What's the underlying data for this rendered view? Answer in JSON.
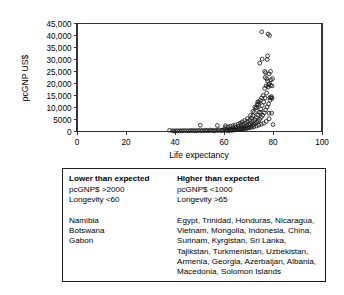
{
  "chart_data": {
    "type": "scatter",
    "title": "",
    "xlabel": "Life expectancy",
    "ylabel": "pcGNP US$",
    "xlim": [
      0,
      100
    ],
    "ylim": [
      0,
      45000
    ],
    "xticks": [
      "0",
      "20",
      "40",
      "60",
      "80",
      "100"
    ],
    "xtick_values": [
      0,
      20,
      40,
      60,
      80,
      100
    ],
    "yticks": [
      "0",
      "5000",
      "10,000",
      "15,000",
      "20,000",
      "25,000",
      "30,000",
      "35,000",
      "40,000",
      "45,000"
    ],
    "ytick_values": [
      0,
      5000,
      10000,
      15000,
      20000,
      25000,
      30000,
      35000,
      40000,
      45000
    ],
    "grid": false,
    "legend": "none",
    "marker": "open-circle",
    "points": [
      [
        37.8,
        500
      ],
      [
        39.0,
        300
      ],
      [
        39.6,
        220
      ],
      [
        40.3,
        260
      ],
      [
        41.0,
        300
      ],
      [
        41.8,
        240
      ],
      [
        42.5,
        330
      ],
      [
        43.2,
        280
      ],
      [
        44.0,
        400
      ],
      [
        44.8,
        250
      ],
      [
        45.5,
        350
      ],
      [
        46.2,
        300
      ],
      [
        46.9,
        420
      ],
      [
        47.6,
        280
      ],
      [
        48.3,
        360
      ],
      [
        49.0,
        300
      ],
      [
        49.7,
        450
      ],
      [
        50.3,
        2600
      ],
      [
        50.6,
        330
      ],
      [
        51.2,
        400
      ],
      [
        51.9,
        300
      ],
      [
        52.5,
        520
      ],
      [
        53.1,
        380
      ],
      [
        53.8,
        300
      ],
      [
        54.4,
        600
      ],
      [
        55.0,
        420
      ],
      [
        55.6,
        350
      ],
      [
        56.2,
        300
      ],
      [
        56.8,
        480
      ],
      [
        57.3,
        2500
      ],
      [
        57.5,
        420
      ],
      [
        58.1,
        700
      ],
      [
        58.7,
        380
      ],
      [
        59.2,
        500
      ],
      [
        59.8,
        450
      ],
      [
        60.3,
        900
      ],
      [
        60.6,
        2400
      ],
      [
        60.9,
        600
      ],
      [
        61.4,
        700
      ],
      [
        61.9,
        450
      ],
      [
        62.4,
        1100
      ],
      [
        62.9,
        800
      ],
      [
        63.3,
        600
      ],
      [
        63.7,
        1500
      ],
      [
        64.1,
        900
      ],
      [
        64.5,
        700
      ],
      [
        64.9,
        1900
      ],
      [
        65.2,
        1200
      ],
      [
        65.6,
        800
      ],
      [
        66.0,
        2100
      ],
      [
        66.3,
        1400
      ],
      [
        66.7,
        1000
      ],
      [
        67.0,
        2600
      ],
      [
        67.3,
        1700
      ],
      [
        67.6,
        1100
      ],
      [
        67.9,
        3100
      ],
      [
        68.2,
        2000
      ],
      [
        68.5,
        1300
      ],
      [
        68.8,
        3600
      ],
      [
        69.1,
        2400
      ],
      [
        69.4,
        1500
      ],
      [
        69.7,
        4100
      ],
      [
        70.0,
        2800
      ],
      [
        70.2,
        1800
      ],
      [
        70.5,
        4800
      ],
      [
        70.7,
        3200
      ],
      [
        71.0,
        2100
      ],
      [
        71.2,
        5600
      ],
      [
        71.4,
        3700
      ],
      [
        71.6,
        2500
      ],
      [
        71.8,
        6600
      ],
      [
        72.0,
        4300
      ],
      [
        72.2,
        2900
      ],
      [
        72.4,
        8000
      ],
      [
        72.6,
        5000
      ],
      [
        72.8,
        3300
      ],
      [
        73.0,
        9800
      ],
      [
        73.2,
        5900
      ],
      [
        73.4,
        3800
      ],
      [
        73.6,
        11400
      ],
      [
        73.8,
        6900
      ],
      [
        74.0,
        4400
      ],
      [
        74.2,
        12200
      ],
      [
        74.4,
        8000
      ],
      [
        74.6,
        5100
      ],
      [
        74.8,
        13000
      ],
      [
        75.0,
        9300
      ],
      [
        75.2,
        5900
      ],
      [
        75.4,
        14000
      ],
      [
        75.6,
        10800
      ],
      [
        75.8,
        6800
      ],
      [
        76.0,
        15000
      ],
      [
        76.2,
        12300
      ],
      [
        76.4,
        7800
      ],
      [
        76.6,
        18000
      ],
      [
        76.8,
        14000
      ],
      [
        77.0,
        9000
      ],
      [
        77.2,
        19000
      ],
      [
        77.4,
        16000
      ],
      [
        77.6,
        10200
      ],
      [
        77.8,
        21000
      ],
      [
        78.0,
        18500
      ],
      [
        78.2,
        11500
      ],
      [
        78.4,
        24000
      ],
      [
        78.6,
        20000
      ],
      [
        78.8,
        13000
      ],
      [
        79.0,
        25000
      ],
      [
        79.2,
        21500
      ],
      [
        79.4,
        14500
      ],
      [
        79.6,
        19000
      ],
      [
        79.8,
        22000
      ],
      [
        80.0,
        2900
      ],
      [
        79.4,
        7700
      ],
      [
        78.4,
        5300
      ],
      [
        77.2,
        4200
      ],
      [
        76.2,
        3400
      ],
      [
        75.2,
        3000
      ],
      [
        74.2,
        2600
      ],
      [
        73.2,
        2300
      ],
      [
        72.2,
        2000
      ],
      [
        71.2,
        1700
      ],
      [
        70.2,
        1500
      ],
      [
        69.2,
        1300
      ],
      [
        68.2,
        1100
      ],
      [
        67.2,
        950
      ],
      [
        66.2,
        800
      ],
      [
        65.2,
        700
      ],
      [
        64.2,
        600
      ],
      [
        63.2,
        520
      ],
      [
        62.2,
        450
      ],
      [
        61.2,
        400
      ],
      [
        74.6,
        28500
      ],
      [
        75.6,
        30200
      ],
      [
        77.6,
        30000
      ],
      [
        77.8,
        31500
      ],
      [
        75.4,
        41500
      ],
      [
        78.0,
        40600
      ],
      [
        78.6,
        40000
      ],
      [
        76.6,
        25000
      ],
      [
        77.0,
        24500
      ],
      [
        76.8,
        22500
      ],
      [
        77.4,
        22000
      ],
      [
        78.2,
        19500
      ],
      [
        79.0,
        19200
      ],
      [
        78.8,
        14200
      ],
      [
        79.2,
        14000
      ],
      [
        79.6,
        13800
      ],
      [
        73.8,
        12300
      ],
      [
        74.0,
        11200
      ],
      [
        72.6,
        10200
      ],
      [
        73.4,
        10000
      ],
      [
        71.8,
        8400
      ],
      [
        75.0,
        8000
      ],
      [
        78.4,
        7600
      ],
      [
        70.8,
        6700
      ],
      [
        69.6,
        5400
      ],
      [
        68.4,
        4600
      ],
      [
        67.4,
        4000
      ],
      [
        66.6,
        3500
      ],
      [
        65.8,
        3000
      ],
      [
        64.6,
        2700
      ],
      [
        63.6,
        2400
      ],
      [
        62.6,
        2200
      ],
      [
        61.6,
        1900
      ],
      [
        60.4,
        1600
      ]
    ]
  },
  "table": {
    "columns": [
      {
        "header": "Lower than expected",
        "criteria": [
          "pcGNP$ >2000",
          "Longevity <60"
        ],
        "entries": [
          "Namibia",
          "Botswana",
          "Gabon"
        ]
      },
      {
        "header": "Higher than expected",
        "criteria": [
          "pcGNP$ <1000",
          "Longevity >65"
        ],
        "entries": [
          "Egypt, Trinidad, Honduras, Nicaragua,",
          "Vietnam, Mongolia, Indonesia, China,",
          "Surinam, Kyrgistan, Sri Lanka,",
          "Tajikstan, Turkmenistan, Uzbekistan,",
          "Armenia, Georgia, Azerbaijan, Albania,",
          "Macedonia, Solomon Islands"
        ]
      }
    ]
  },
  "colors": {
    "axis": "#333333",
    "marker_stroke": "#1a1a1a",
    "border": "#1a1a1a",
    "background": "#ffffff"
  }
}
